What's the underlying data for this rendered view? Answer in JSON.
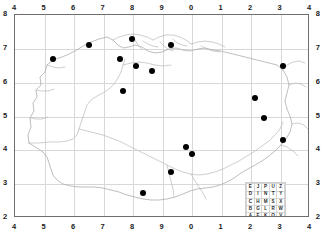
{
  "chart_data": {
    "type": "scatter",
    "title": "",
    "xlabel": "",
    "ylabel": "",
    "xlim": [
      4,
      14
    ],
    "ylim": [
      2,
      8
    ],
    "grid": true,
    "legend_position": "bottom-right",
    "x_ticks_top": [
      "4",
      "5",
      "6",
      "7",
      "8",
      "9",
      "0",
      "1",
      "2",
      "3",
      "4"
    ],
    "x_ticks_bottom": [
      "4",
      "5",
      "6",
      "7",
      "8",
      "9",
      "0",
      "1",
      "2",
      "3",
      "4"
    ],
    "y_ticks_left": [
      "8",
      "7",
      "6",
      "5",
      "4",
      "3",
      "2"
    ],
    "y_ticks_right": [
      "8",
      "7",
      "6",
      "5",
      "4",
      "3",
      "2"
    ],
    "series": [
      {
        "name": "sites",
        "marker": "filled-circle",
        "color": "#000000",
        "points": [
          {
            "x": 5.3,
            "y": 6.7
          },
          {
            "x": 6.5,
            "y": 7.1
          },
          {
            "x": 7.95,
            "y": 7.3
          },
          {
            "x": 9.3,
            "y": 7.1
          },
          {
            "x": 7.55,
            "y": 6.7
          },
          {
            "x": 8.1,
            "y": 6.5
          },
          {
            "x": 8.65,
            "y": 6.35
          },
          {
            "x": 13.1,
            "y": 6.5
          },
          {
            "x": 7.65,
            "y": 5.75
          },
          {
            "x": 12.15,
            "y": 5.55
          },
          {
            "x": 12.45,
            "y": 4.95
          },
          {
            "x": 13.1,
            "y": 4.3
          },
          {
            "x": 9.8,
            "y": 4.1
          },
          {
            "x": 10.0,
            "y": 3.9
          },
          {
            "x": 9.3,
            "y": 3.35
          },
          {
            "x": 8.35,
            "y": 2.75
          }
        ]
      }
    ]
  },
  "legend": {
    "name": "letter-square",
    "rows": [
      [
        "E",
        "J",
        "P",
        "U",
        "Z"
      ],
      [
        "D",
        "I",
        "N",
        "T",
        "Y"
      ],
      [
        "C",
        "H",
        "M",
        "S",
        "X"
      ],
      [
        "B",
        "G",
        "L",
        "R",
        "W"
      ],
      [
        "A",
        "F",
        "K",
        "Q",
        "V"
      ]
    ]
  }
}
